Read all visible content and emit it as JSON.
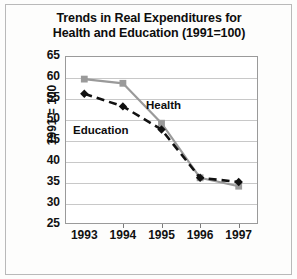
{
  "chart_data": {
    "type": "line",
    "title": "Trends in Real Expenditures for Health and Education  (1991=100)",
    "title_line1": "Trends in Real Expenditures for",
    "title_line2": "Health and Education  (1991=100)",
    "xlabel": "",
    "ylabel": "1991 = 100",
    "categories": [
      "1993",
      "1994",
      "1995",
      "1996",
      "1997"
    ],
    "x": [
      1993,
      1994,
      1995,
      1996,
      1997
    ],
    "ylim": [
      25,
      65
    ],
    "yticks": [
      65,
      60,
      55,
      50,
      45,
      40,
      35,
      30,
      25
    ],
    "grid": true,
    "legend_position": "inline-annotations",
    "series": [
      {
        "name": "Health",
        "values": [
          59.5,
          58.5,
          49,
          36,
          34
        ],
        "color": "#9a9a9a",
        "marker": "square",
        "line_style": "solid"
      },
      {
        "name": "Education",
        "values": [
          56,
          53,
          47.5,
          36,
          35
        ],
        "color": "#111111",
        "marker": "diamond",
        "line_style": "dashed"
      }
    ],
    "annotations": [
      {
        "text": "Health",
        "series": "Health"
      },
      {
        "text": "Education",
        "series": "Education"
      }
    ]
  }
}
